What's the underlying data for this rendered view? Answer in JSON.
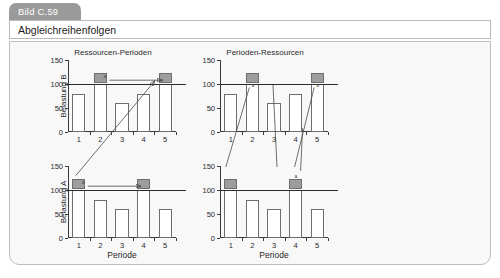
{
  "figure": {
    "tab_label": "Bild C.59",
    "title": "Abgleichreihenfolgen"
  },
  "charts": [
    {
      "id": "top-left",
      "title": "Ressourcen-Perioden",
      "ylabel": "Belastung B",
      "xlabel": "",
      "show_xlabel": false
    },
    {
      "id": "top-right",
      "title": "Perioden-Ressourcen",
      "ylabel": "",
      "xlabel": "",
      "show_xlabel": false
    },
    {
      "id": "bottom-left",
      "title": "",
      "ylabel": "Belastung A",
      "xlabel": "Periode",
      "show_xlabel": true
    },
    {
      "id": "bottom-right",
      "title": "",
      "ylabel": "",
      "xlabel": "Periode",
      "show_xlabel": true
    }
  ],
  "colors": {
    "overload_fill": "#9d9d9d",
    "bar_fill": "#ffffff",
    "bar_stroke": "#6e6e6e",
    "axis": "#3a3a3a",
    "capacity_line": "#2b2b2b",
    "panel_bg": "#f8f8f8",
    "tab_bg": "#9a9a9a"
  },
  "chart_data": [
    {
      "type": "bar",
      "id": "top-left",
      "title": "Ressourcen-Perioden",
      "xlabel": "Periode",
      "ylabel": "Belastung B",
      "categories": [
        "1",
        "2",
        "3",
        "4",
        "5"
      ],
      "values": [
        80,
        120,
        60,
        80,
        120
      ],
      "capacity": 100,
      "overload_segments": [
        {
          "category": "2",
          "from": 100,
          "to": 120
        },
        {
          "category": "5",
          "from": 100,
          "to": 120
        }
      ],
      "yticks": [
        0,
        50,
        100,
        150
      ],
      "ylim": [
        0,
        150
      ],
      "grid": false,
      "annotations": [
        {
          "type": "arrow",
          "label": "a",
          "from_category": "2",
          "to_category": "5",
          "at_value": 110
        }
      ]
    },
    {
      "type": "bar",
      "id": "top-right",
      "title": "Perioden-Ressourcen",
      "xlabel": "Periode",
      "ylabel": "",
      "categories": [
        "1",
        "2",
        "3",
        "4",
        "5"
      ],
      "values": [
        80,
        120,
        60,
        80,
        120
      ],
      "capacity": 100,
      "overload_segments": [
        {
          "category": "2",
          "from": 100,
          "to": 120
        },
        {
          "category": "5",
          "from": 100,
          "to": 120
        }
      ],
      "yticks": [
        0,
        50,
        100,
        150
      ],
      "ylim": [
        0,
        150
      ],
      "grid": false,
      "annotations": [
        {
          "type": "marker",
          "label": "a",
          "category": "2",
          "at_value": 95
        },
        {
          "type": "marker",
          "label": "a",
          "category": "5",
          "at_value": 95
        }
      ]
    },
    {
      "type": "bar",
      "id": "bottom-left",
      "title": "",
      "xlabel": "Periode",
      "ylabel": "Belastung A",
      "categories": [
        "1",
        "2",
        "3",
        "4",
        "5"
      ],
      "values": [
        120,
        80,
        60,
        120,
        60
      ],
      "capacity": 100,
      "overload_segments": [
        {
          "category": "1",
          "from": 100,
          "to": 120
        },
        {
          "category": "4",
          "from": 100,
          "to": 120
        }
      ],
      "yticks": [
        0,
        50,
        100,
        150
      ],
      "ylim": [
        0,
        150
      ],
      "grid": false,
      "annotations": [
        {
          "type": "arrow",
          "label": "a",
          "from_category": "1",
          "to_category": "4",
          "at_value": 110
        }
      ]
    },
    {
      "type": "bar",
      "id": "bottom-right",
      "title": "",
      "xlabel": "Periode",
      "ylabel": "",
      "categories": [
        "1",
        "2",
        "3",
        "4",
        "5"
      ],
      "values": [
        120,
        80,
        60,
        120,
        60
      ],
      "capacity": 100,
      "overload_segments": [
        {
          "category": "1",
          "from": 100,
          "to": 120
        },
        {
          "category": "4",
          "from": 100,
          "to": 120
        }
      ],
      "yticks": [
        0,
        50,
        100,
        150
      ],
      "ylim": [
        0,
        150
      ],
      "grid": false,
      "annotations": [
        {
          "type": "marker",
          "label": "a",
          "category": "4",
          "at_value": 128
        }
      ]
    }
  ]
}
